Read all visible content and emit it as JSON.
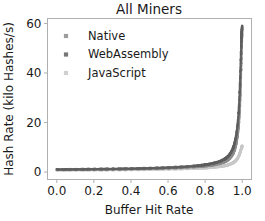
{
  "chart_data": {
    "type": "scatter",
    "title": "All Miners",
    "xlabel": "Buffer Hit Rate",
    "ylabel": "Hash Rate (kilo Hashes/s)",
    "xlim": [
      -0.05,
      1.05
    ],
    "ylim": [
      -3,
      62
    ],
    "xticks": [
      "0.0",
      "0.2",
      "0.4",
      "0.6",
      "0.8",
      "1.0"
    ],
    "xtick_values": [
      0.0,
      0.2,
      0.4,
      0.6,
      0.8,
      1.0
    ],
    "yticks": [
      "0",
      "20",
      "40",
      "60"
    ],
    "ytick_values": [
      0,
      20,
      40,
      60
    ],
    "grid": false,
    "legend_position": "upper left",
    "marker": "square-small",
    "series": [
      {
        "name": "Native",
        "color": "#8c8c8c",
        "x": [
          0.0,
          0.05,
          0.1,
          0.15,
          0.2,
          0.25,
          0.3,
          0.35,
          0.4,
          0.45,
          0.5,
          0.55,
          0.6,
          0.65,
          0.7,
          0.75,
          0.78,
          0.8,
          0.82,
          0.84,
          0.86,
          0.88,
          0.9,
          0.91,
          0.92,
          0.93,
          0.94,
          0.95,
          0.955,
          0.96,
          0.965,
          0.97,
          0.975,
          0.98,
          0.983,
          0.986,
          0.988,
          0.99,
          0.992,
          0.994,
          0.995,
          0.996,
          0.997,
          0.998,
          0.999,
          1.0
        ],
        "y": [
          0.95,
          0.97,
          1.0,
          1.03,
          1.06,
          1.1,
          1.14,
          1.18,
          1.24,
          1.3,
          1.38,
          1.46,
          1.57,
          1.7,
          1.88,
          2.12,
          2.3,
          2.45,
          2.62,
          2.84,
          3.1,
          3.45,
          3.95,
          4.3,
          4.75,
          5.35,
          6.15,
          7.3,
          8.1,
          9.1,
          10.4,
          12.1,
          14.4,
          17.6,
          20.3,
          24.0,
          27.0,
          30.8,
          35.5,
          41.0,
          44.2,
          47.5,
          50.5,
          53.0,
          55.0,
          56.5
        ]
      },
      {
        "name": "WebAssembly",
        "color": "#5e5e5e",
        "x": [
          0.0,
          0.05,
          0.1,
          0.15,
          0.2,
          0.25,
          0.3,
          0.35,
          0.4,
          0.45,
          0.5,
          0.55,
          0.6,
          0.65,
          0.7,
          0.75,
          0.78,
          0.8,
          0.82,
          0.84,
          0.86,
          0.88,
          0.9,
          0.91,
          0.92,
          0.93,
          0.94,
          0.95,
          0.955,
          0.96,
          0.965,
          0.97,
          0.975,
          0.98,
          0.983,
          0.986,
          0.988,
          0.99,
          0.992,
          0.994,
          0.995,
          0.996,
          0.997,
          0.998,
          0.999,
          1.0
        ],
        "y": [
          1.05,
          1.08,
          1.11,
          1.15,
          1.19,
          1.23,
          1.28,
          1.34,
          1.4,
          1.48,
          1.57,
          1.68,
          1.82,
          1.99,
          2.22,
          2.52,
          2.75,
          2.95,
          3.18,
          3.48,
          3.85,
          4.35,
          5.05,
          5.5,
          6.1,
          6.9,
          8.0,
          9.55,
          10.6,
          12.0,
          13.8,
          16.1,
          19.3,
          23.6,
          27.2,
          32.0,
          35.8,
          40.5,
          45.8,
          50.5,
          53.0,
          55.0,
          56.4,
          57.4,
          58.0,
          58.3
        ]
      },
      {
        "name": "JavaScript",
        "color": "#c8c8c8",
        "x": [
          0.0,
          0.05,
          0.1,
          0.15,
          0.2,
          0.25,
          0.3,
          0.35,
          0.4,
          0.45,
          0.5,
          0.55,
          0.6,
          0.65,
          0.7,
          0.75,
          0.78,
          0.8,
          0.82,
          0.84,
          0.86,
          0.88,
          0.9,
          0.91,
          0.92,
          0.93,
          0.94,
          0.95,
          0.955,
          0.96,
          0.965,
          0.97,
          0.975,
          0.98,
          0.983,
          0.986,
          0.988,
          0.99,
          0.992,
          0.994,
          0.995,
          0.996,
          0.997,
          0.998,
          0.999,
          1.0
        ],
        "y": [
          0.7,
          0.72,
          0.74,
          0.76,
          0.78,
          0.81,
          0.84,
          0.87,
          0.91,
          0.95,
          1.0,
          1.06,
          1.13,
          1.21,
          1.32,
          1.46,
          1.56,
          1.64,
          1.74,
          1.86,
          2.01,
          2.2,
          2.45,
          2.61,
          2.8,
          3.04,
          3.34,
          3.72,
          3.96,
          4.24,
          4.58,
          5.0,
          5.52,
          6.2,
          6.72,
          7.3,
          7.72,
          8.2,
          8.75,
          9.3,
          9.58,
          9.82,
          10.0,
          10.2,
          10.3,
          10.4
        ]
      }
    ]
  },
  "legend": {
    "items": [
      {
        "label": "Native",
        "color": "#8c8c8c"
      },
      {
        "label": "WebAssembly",
        "color": "#5e5e5e"
      },
      {
        "label": "JavaScript",
        "color": "#c8c8c8"
      }
    ]
  }
}
